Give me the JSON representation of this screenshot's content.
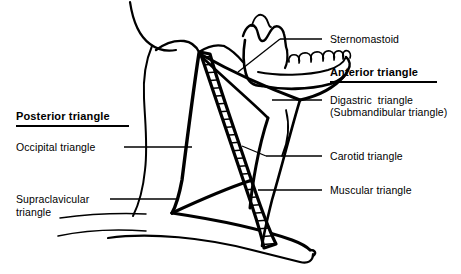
{
  "figure": {
    "background": "#ffffff",
    "ink": "#000000"
  },
  "labels": {
    "posterior_heading": "Posterior triangle",
    "occipital": "Occipital triangle",
    "supraclavicular_line1": "Supraclavicular",
    "supraclavicular_line2": "triangle",
    "sternomastoid": "Sternomastoid",
    "anterior_heading": "Anterior triangle",
    "digastric_line1": "Digastric  triangle",
    "digastric_line2": "(Submandibular triangle)",
    "carotid": "Carotid triangle",
    "muscular": "Muscular triangle"
  },
  "anatomy": {
    "structures": [
      "head-and-neck-outline",
      "mandible-with-teeth",
      "sternomastoid-muscle-hatched",
      "trapezius-border",
      "clavicle",
      "omohyoid-muscle",
      "digastric-muscle"
    ],
    "regions": [
      "posterior-triangle",
      "occipital-triangle",
      "supraclavicular-triangle",
      "anterior-triangle",
      "digastric-triangle",
      "carotid-triangle",
      "muscular-triangle"
    ]
  }
}
